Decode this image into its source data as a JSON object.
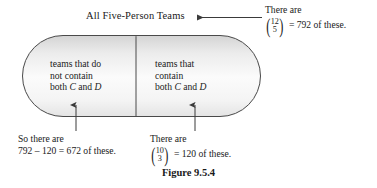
{
  "figure": {
    "caption": "Figure 9.5.4",
    "set_title": "All Five-Person Teams"
  },
  "regions": {
    "left": {
      "line1": "teams that do",
      "line2": "not contain",
      "line3_prefix": "both ",
      "line3_var1": "C",
      "line3_mid": " and ",
      "line3_var2": "D"
    },
    "right": {
      "line1": "teams that",
      "line2": "contain",
      "line3_prefix": "both ",
      "line3_var1": "C",
      "line3_mid": " and ",
      "line3_var2": "D"
    }
  },
  "callouts": {
    "top_right": {
      "line1": "There are",
      "binom_top": "12",
      "binom_bottom": "5",
      "result": "= 792 of these."
    },
    "bottom_left": {
      "line1": "So there are",
      "line2": "792 – 120 = 672 of these."
    },
    "bottom_middle": {
      "line1": "There are",
      "binom_top": "10",
      "binom_bottom": "3",
      "result": "= 120 of these."
    }
  },
  "colors": {
    "stroke": "#3a3a3a",
    "fill_light": "#ffffff",
    "fill_shade": "#d8d8d8",
    "text": "#1a1a1a"
  }
}
